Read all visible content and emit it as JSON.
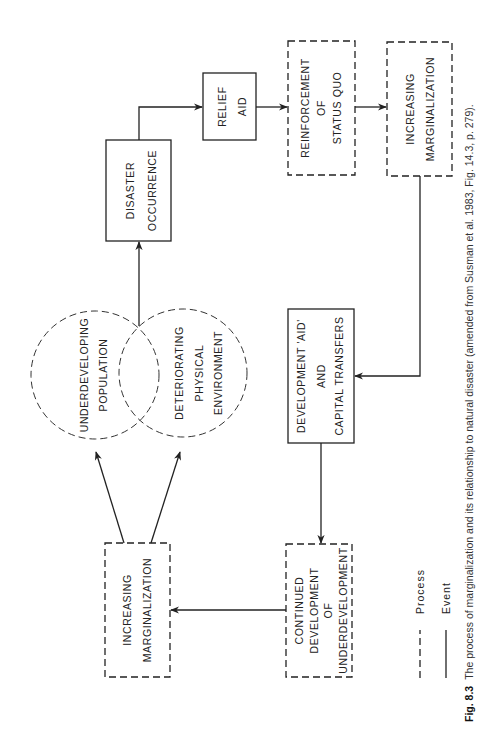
{
  "figure": {
    "caption_label": "Fig. 8.3",
    "caption_text": "The process of marginalization and its relationship to natural disaster (amended from Susman et al. 1983, Fig. 14.3, p. 279)."
  },
  "nodes": {
    "disaster_occurrence": {
      "type": "event",
      "lines": [
        "DISASTER",
        "OCCURRENCE"
      ]
    },
    "relief_aid": {
      "type": "event",
      "lines": [
        "RELIEF",
        "AID"
      ]
    },
    "reinforcement_status_quo": {
      "type": "process",
      "lines": [
        "REINFORCEMENT",
        "OF",
        "STATUS QUO"
      ]
    },
    "increasing_marginalization_top": {
      "type": "process",
      "lines": [
        "INCREASING",
        "MARGINALIZATION"
      ]
    },
    "development_aid": {
      "type": "event",
      "lines": [
        "DEVELOPMENT 'AID'",
        "AND",
        "CAPITAL TRANSFERS"
      ]
    },
    "continued_development": {
      "type": "process",
      "lines": [
        "CONTINUED",
        "DEVELOPMENT",
        "OF",
        "UNDERDEVELOPMENT"
      ]
    },
    "increasing_marginalization_bottom": {
      "type": "process",
      "lines": [
        "INCREASING",
        "MARGINALIZATION"
      ]
    },
    "underdeveloping_population": {
      "type": "process-circle",
      "lines": [
        "UNDERDEVELOPING",
        "POPULATION"
      ]
    },
    "deteriorating_environment": {
      "type": "process-circle",
      "lines": [
        "DETERIORATING",
        "PHYSICAL",
        "ENVIRONMENT"
      ]
    }
  },
  "edges": [
    {
      "from": "underdeveloping_population+deteriorating_environment",
      "to": "disaster_occurrence"
    },
    {
      "from": "disaster_occurrence",
      "to": "relief_aid"
    },
    {
      "from": "relief_aid",
      "to": "reinforcement_status_quo"
    },
    {
      "from": "reinforcement_status_quo",
      "to": "increasing_marginalization_top"
    },
    {
      "from": "increasing_marginalization_top",
      "to": "development_aid"
    },
    {
      "from": "development_aid",
      "to": "continued_development"
    },
    {
      "from": "continued_development",
      "to": "increasing_marginalization_bottom"
    },
    {
      "from": "increasing_marginalization_bottom",
      "to": "underdeveloping_population"
    },
    {
      "from": "increasing_marginalization_bottom",
      "to": "deteriorating_environment"
    }
  ],
  "legend": {
    "process": "Process",
    "event": "Event"
  }
}
